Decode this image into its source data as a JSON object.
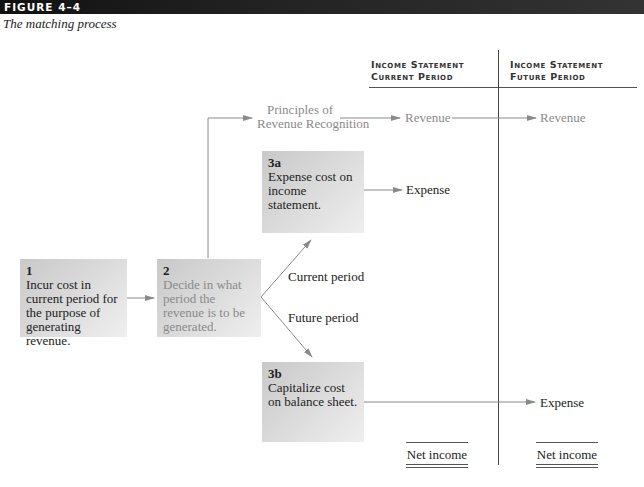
{
  "figure": {
    "label": "FIGURE 4–4",
    "caption": "The matching process"
  },
  "columns": [
    {
      "line1": "Income Statement",
      "line2": "Current Period"
    },
    {
      "line1": "Income Statement",
      "line2": "Future Period"
    }
  ],
  "boxes": {
    "step1": {
      "num": "1",
      "text": "Incur cost in current period for the purpose of generating revenue."
    },
    "step2": {
      "num": "2",
      "text": "Decide in what period the revenue is to be generated."
    },
    "step3a": {
      "num": "3a",
      "text": "Expense cost on income statement."
    },
    "step3b": {
      "num": "3b",
      "text": "Capitalize cost on balance sheet."
    }
  },
  "labels": {
    "principles_line1": "Principles of",
    "principles_line2": "Revenue Recognition",
    "revenue_current": "Revenue",
    "revenue_future": "Revenue",
    "expense_current": "Expense",
    "expense_future": "Expense",
    "current_period": "Current period",
    "future_period": "Future period",
    "net_income_current": "Net income",
    "net_income_future": "Net income"
  },
  "colors": {
    "arrow": "#8a8a8a",
    "box_dark": "#c9c9c9",
    "box_light": "#efefef",
    "gray_text": "#8a8a8a",
    "figure_bar": "#1a1a1a"
  }
}
